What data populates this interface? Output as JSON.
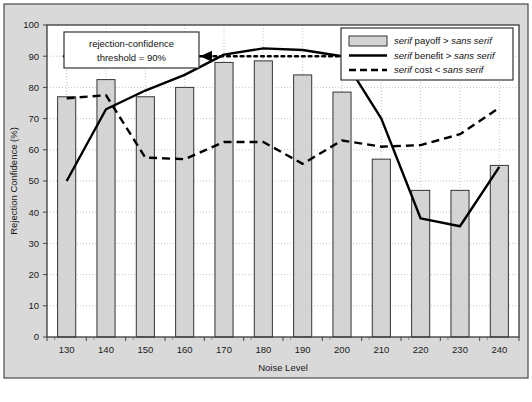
{
  "figure": {
    "outer_bg": "#d9d9d9",
    "plot_bg": "#ffffff",
    "border_color": "#4a4a4a",
    "bar_fill": "#d4d4d4",
    "bar_stroke": "#333333",
    "line_color": "#000000",
    "grid_color": "#bdbdbd"
  },
  "annotation": {
    "line1": "rejection-confidence",
    "line2": "threshold = 90%",
    "threshold_value": 90
  },
  "legend": {
    "position": "top-right",
    "items": [
      {
        "marker": "bar-swatch",
        "pre": "serif",
        "mid": " payoff > ",
        "post": "sans serif"
      },
      {
        "marker": "solid-line",
        "pre": "serif",
        "mid": " benefit > ",
        "post": "sans serif"
      },
      {
        "marker": "dashed-line",
        "pre": "serif",
        "mid": " cost < ",
        "post": "sans serif"
      }
    ]
  },
  "chart_data": {
    "type": "bar",
    "title": "",
    "xlabel": "Noise Level",
    "ylabel": "Rejection Confidence (%)",
    "categories": [
      130,
      140,
      150,
      160,
      170,
      180,
      190,
      200,
      210,
      220,
      230,
      240
    ],
    "xtick_labels": [
      "130",
      "140",
      "150",
      "160",
      "170",
      "180",
      "190",
      "200",
      "210",
      "220",
      "230",
      "240"
    ],
    "ylim": [
      0,
      100
    ],
    "ytick_labels": [
      "0",
      "10",
      "20",
      "30",
      "40",
      "50",
      "60",
      "70",
      "80",
      "90",
      "100"
    ],
    "yticks": [
      0,
      10,
      20,
      30,
      40,
      50,
      60,
      70,
      80,
      90,
      100
    ],
    "grid": true,
    "series": [
      {
        "name": "serif payoff > sans serif",
        "kind": "bar",
        "values": [
          77,
          82.5,
          77,
          80,
          88,
          88.5,
          84,
          78.5,
          57,
          47,
          47,
          55
        ]
      },
      {
        "name": "serif benefit > sans serif",
        "kind": "line",
        "style": "solid",
        "values": [
          50,
          73,
          79,
          84,
          90.5,
          92.5,
          92,
          90,
          70,
          38,
          35.5,
          54.5
        ]
      },
      {
        "name": "serif cost < sans serif",
        "kind": "line",
        "style": "dashed",
        "values": [
          76.5,
          77.5,
          57.5,
          57,
          62.5,
          62.5,
          55.5,
          63,
          61,
          61.5,
          65,
          73.5
        ]
      },
      {
        "name": "rejection-confidence threshold = 90%",
        "kind": "line",
        "style": "dotted",
        "constant": 90
      }
    ]
  }
}
